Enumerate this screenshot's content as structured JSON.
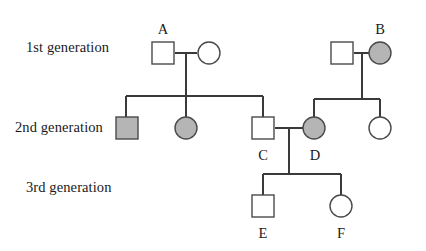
{
  "diagram": {
    "type": "pedigree-chart",
    "title": "",
    "generation_labels": [
      {
        "id": "gen1",
        "text": "1st generation"
      },
      {
        "id": "gen2",
        "text": "2nd generation"
      },
      {
        "id": "gen3",
        "text": "3rd generation"
      }
    ],
    "colors": {
      "background": "#ffffff",
      "line": "#3a3a3a",
      "symbol_stroke": "#4a4a4a",
      "affected_fill": "#b5b5b5",
      "unaffected_fill": "#ffffff",
      "text": "#1a1a1a"
    },
    "legend_meaning": {
      "square": "male",
      "circle": "female",
      "shaded": "affected",
      "unshaded": "unaffected"
    },
    "individuals": [
      {
        "id": "A",
        "label": "A",
        "shape": "square",
        "sex": "male",
        "affected": false,
        "generation": 1,
        "cx": 163,
        "cy": 53
      },
      {
        "id": "gen1-mother-left",
        "label": "",
        "shape": "circle",
        "sex": "female",
        "affected": false,
        "generation": 1,
        "cx": 209,
        "cy": 53
      },
      {
        "id": "gen1-father-right",
        "label": "",
        "shape": "square",
        "sex": "male",
        "affected": false,
        "generation": 1,
        "cx": 342,
        "cy": 53
      },
      {
        "id": "B",
        "label": "B",
        "shape": "circle",
        "sex": "female",
        "affected": true,
        "generation": 1,
        "cx": 380,
        "cy": 53
      },
      {
        "id": "gen2-son-left",
        "label": "",
        "shape": "square",
        "sex": "male",
        "affected": true,
        "generation": 2,
        "cx": 127,
        "cy": 128
      },
      {
        "id": "gen2-daughter-left",
        "label": "",
        "shape": "circle",
        "sex": "female",
        "affected": true,
        "generation": 2,
        "cx": 186,
        "cy": 128
      },
      {
        "id": "C",
        "label": "C",
        "shape": "square",
        "sex": "male",
        "affected": false,
        "generation": 2,
        "cx": 263,
        "cy": 128
      },
      {
        "id": "D",
        "label": "D",
        "shape": "circle",
        "sex": "female",
        "affected": true,
        "generation": 2,
        "cx": 314,
        "cy": 128
      },
      {
        "id": "gen2-daughter-right",
        "label": "",
        "shape": "circle",
        "sex": "female",
        "affected": false,
        "generation": 2,
        "cx": 380,
        "cy": 128
      },
      {
        "id": "E",
        "label": "E",
        "shape": "square",
        "sex": "male",
        "affected": false,
        "generation": 3,
        "cx": 263,
        "cy": 206
      },
      {
        "id": "F",
        "label": "F",
        "shape": "circle",
        "sex": "female",
        "affected": false,
        "generation": 3,
        "cx": 341,
        "cy": 206
      }
    ],
    "matings": [
      {
        "id": "mating-gen1-left",
        "partners": [
          "A",
          "gen1-mother-left"
        ],
        "children": [
          "gen2-son-left",
          "gen2-daughter-left",
          "C"
        ]
      },
      {
        "id": "mating-gen1-right",
        "partners": [
          "gen1-father-right",
          "B"
        ],
        "children": [
          "D",
          "gen2-daughter-right"
        ]
      },
      {
        "id": "mating-gen2-center",
        "partners": [
          "C",
          "D"
        ],
        "children": [
          "E",
          "F"
        ]
      }
    ]
  }
}
